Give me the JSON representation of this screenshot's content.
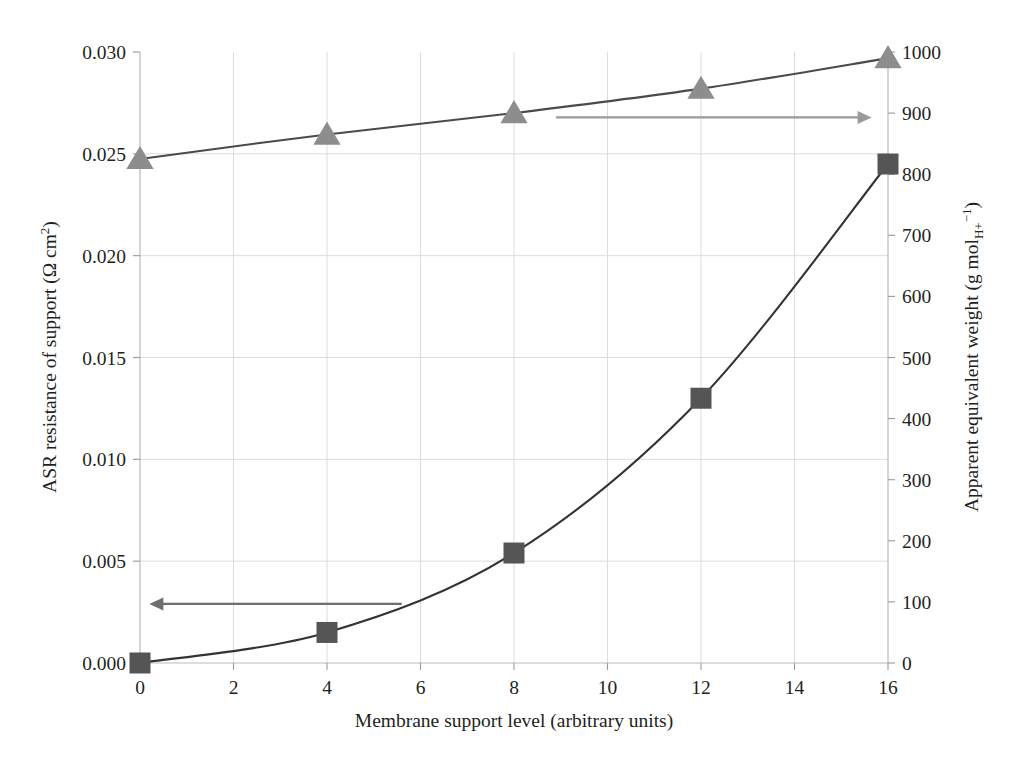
{
  "chart_data": {
    "type": "line",
    "title": "",
    "xlabel": "Membrane support level (arbitrary units)",
    "ylabel": "ASR resistance of support (Ω cm²)",
    "y2label": "Apparent equivalent weight (g molₕ₊⁻¹)",
    "x": [
      0,
      4,
      8,
      12,
      16
    ],
    "xlim": [
      0,
      16
    ],
    "xticks": [
      "0",
      "2",
      "4",
      "6",
      "8",
      "10",
      "12",
      "14",
      "16"
    ],
    "xtick_values": [
      0,
      2,
      4,
      6,
      8,
      10,
      12,
      14,
      16
    ],
    "ylim": [
      0.0,
      0.03
    ],
    "yticks": [
      "0.000",
      "0.005",
      "0.010",
      "0.015",
      "0.020",
      "0.025",
      "0.030"
    ],
    "ytick_values": [
      0.0,
      0.005,
      0.01,
      0.015,
      0.02,
      0.025,
      0.03
    ],
    "y2lim": [
      0,
      1000
    ],
    "y2ticks": [
      "0",
      "100",
      "200",
      "300",
      "400",
      "500",
      "600",
      "700",
      "800",
      "900",
      "1000"
    ],
    "y2tick_values": [
      0,
      100,
      200,
      300,
      400,
      500,
      600,
      700,
      800,
      900,
      1000
    ],
    "grid": true,
    "legend": "none",
    "series": [
      {
        "name": "ASR resistance of support",
        "axis": "left",
        "marker": "square",
        "color": "#555555",
        "line_color": "#333333",
        "values": [
          0.0,
          0.0015,
          0.0054,
          0.013,
          0.0245
        ]
      },
      {
        "name": "Apparent equivalent weight",
        "axis": "right",
        "marker": "triangle",
        "color": "#8d8d8d",
        "line_color": "#4a4a4a",
        "values": [
          825,
          865,
          900,
          940,
          990
        ]
      }
    ],
    "annotations": [
      {
        "name": "left-axis-pointer-arrow",
        "kind": "arrow",
        "direction": "left",
        "color": "#6e6e6e",
        "x_from": 5.6,
        "x_to": 0.2,
        "y_value": 0.0029,
        "axis": "left"
      },
      {
        "name": "right-axis-pointer-arrow",
        "kind": "arrow",
        "direction": "right",
        "color": "#9a9a9a",
        "x_from": 8.9,
        "x_to": 15.65,
        "y_value": 893,
        "axis": "right"
      }
    ]
  },
  "axes": {
    "y_left": {
      "label_main": "ASR resistance of support (Ω cm",
      "label_sup": "2",
      "label_tail": ")"
    },
    "y_right": {
      "label_main": "Apparent equivalent weight (g mol",
      "label_sub": "H+",
      "label_sup": "−1",
      "label_tail": ")"
    },
    "x": {
      "label": "Membrane support level (arbitrary units)"
    }
  }
}
